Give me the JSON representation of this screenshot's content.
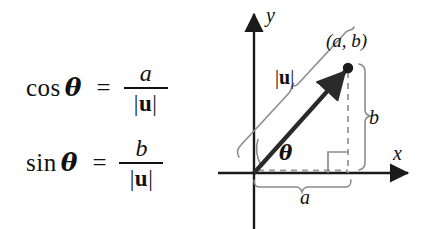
{
  "figure": {
    "background_color": "#ffffff"
  },
  "equations": [
    {
      "id": "cos",
      "function": "cos",
      "angle": "θ",
      "relation": "=",
      "numerator": "a",
      "denominator_open": "|",
      "denominator_symbol": "u",
      "denominator_close": "|"
    },
    {
      "id": "sin",
      "function": "sin",
      "angle": "θ",
      "relation": "=",
      "numerator": "b",
      "denominator_open": "|",
      "denominator_symbol": "u",
      "denominator_close": "|"
    }
  ],
  "diagram": {
    "axis_labels": {
      "x": "x",
      "y": "y"
    },
    "point_label": "(a, b)",
    "magnitude_label_open": "|",
    "magnitude_label_symbol": "u",
    "magnitude_label_close": "|",
    "angle_label": "θ",
    "horizontal_component_label": "a",
    "vertical_component_label": "b",
    "colors": {
      "axis": "#1a1a1a",
      "vector": "#2a2a2a",
      "brace": "#8c8c8c",
      "dashed": "#9a9a9a",
      "right_angle": "#8c8c8c"
    },
    "geometry": {
      "origin": [
        42,
        173
      ],
      "point": [
        136,
        68
      ],
      "x_axis_end": [
        200,
        173
      ],
      "y_axis_top": [
        42,
        10
      ]
    }
  }
}
